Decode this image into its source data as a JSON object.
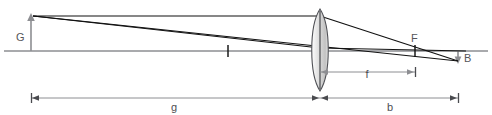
{
  "diagram": {
    "type": "optics-ray-diagram",
    "labels": {
      "object_height": "G",
      "image_height": "B",
      "focal_point": "F",
      "object_distance": "g",
      "image_distance": "b",
      "focal_length": "f"
    },
    "colors": {
      "ray": "#111111",
      "axis": "#8d8e92",
      "dimension": "#8d8e92",
      "label_text": "#55565a",
      "lens_fill_light": "#f2f2f2",
      "lens_fill_dark": "#c9c9c9",
      "lens_outline": "#4f5055",
      "background": "#ffffff"
    },
    "geometry": {
      "axis_y": 51,
      "object_x": 31,
      "object_tip_y": 16,
      "lens_x": 320,
      "lens_top_y": 9,
      "lens_bottom_y": 91,
      "lens_half_width": 10,
      "focal_left_x": 228,
      "focal_right_x": 415,
      "image_x": 458,
      "image_tip_y": 61,
      "dim_row_y": 98,
      "focal_dim_y": 72
    },
    "elements": {
      "optical_axis": "optical-axis",
      "lens": "converging-lens",
      "ray_parallel": "parallel-ray",
      "ray_center": "center-ray",
      "ray_refracted": "refracted-ray"
    }
  }
}
